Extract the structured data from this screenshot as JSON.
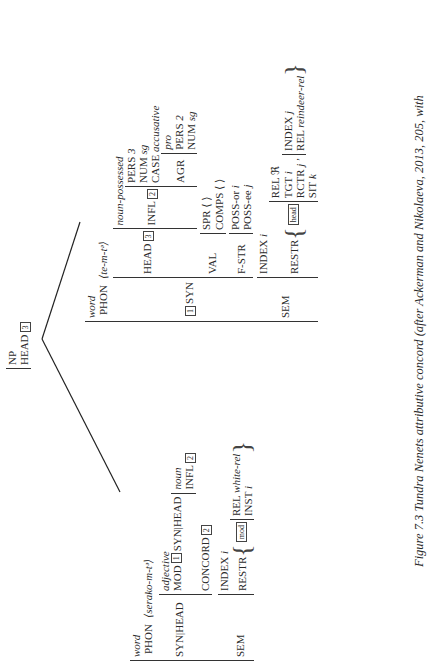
{
  "root": {
    "cat": "NP",
    "head_label": "HEAD",
    "head_tag": "3"
  },
  "adjective": {
    "type": "word",
    "phon_label": "PHON",
    "phon": "⟨serako-m-tᵊ⟩",
    "syn_head_label": "SYN|HEAD",
    "head_type": "adjective",
    "mod_label": "MOD",
    "mod_tag": "1",
    "mod_path": "SYN|HEAD",
    "mod_type": "noun",
    "infl_label": "INFL",
    "infl_tag": "2",
    "concord_label": "CONCORD",
    "concord_tag": "2",
    "sem_label": "SEM",
    "index_label": "INDEX",
    "index_val": "i",
    "restr_label": "RESTR",
    "restr_tag": "mod",
    "rel_label": "REL",
    "rel_val": "white-rel",
    "inst_label": "INST",
    "inst_val": "i"
  },
  "noun": {
    "type": "word",
    "phon_label": "PHON",
    "phon": "⟨te-m-tᵊ⟩",
    "syn_tag": "1",
    "syn_label": "SYN",
    "head_label": "HEAD",
    "head_tag": "3",
    "head_type": "noun-possessed",
    "infl_label": "INFL",
    "infl_tag": "2",
    "pers_label": "PERS",
    "pers_val": "3",
    "num_label": "NUM",
    "num_val": "sg",
    "case_label": "CASE",
    "case_val": "accusative",
    "agr_label": "AGR",
    "agr_type": "pro",
    "agr_pers_label": "PERS",
    "agr_pers_val": "2",
    "agr_num_label": "NUM",
    "agr_num_val": "sg",
    "val_label": "VAL",
    "spr_label": "SPR",
    "spr_val": "⟨ ⟩",
    "comps_label": "COMPS",
    "comps_val": "⟨ ⟩",
    "fstr_label": "F-STR",
    "possor_label": "POSS-or",
    "possor_val": "i",
    "possee_label": "POSS-ee",
    "possee_val": "j",
    "sem_label": "SEM",
    "index_label": "INDEX",
    "index_val": "i",
    "restr_label": "RESTR",
    "restr_tag": "head",
    "rel1_label": "REL",
    "rel1_val": "ℜ",
    "tgt_label": "TGT",
    "tgt_val": "i",
    "rctr_label": "RCTR",
    "rctr_val": "j",
    "sit_label": "SIT",
    "sit_val": "k",
    "idx2_label": "INDEX",
    "idx2_val": "j",
    "rel2_label": "REL",
    "rel2_val": "reindeer-rel"
  },
  "caption": "Figure 7.3 Tundra Nenets attributive concord (after Ackerman and Nikolaeva, 2013, 205, with"
}
